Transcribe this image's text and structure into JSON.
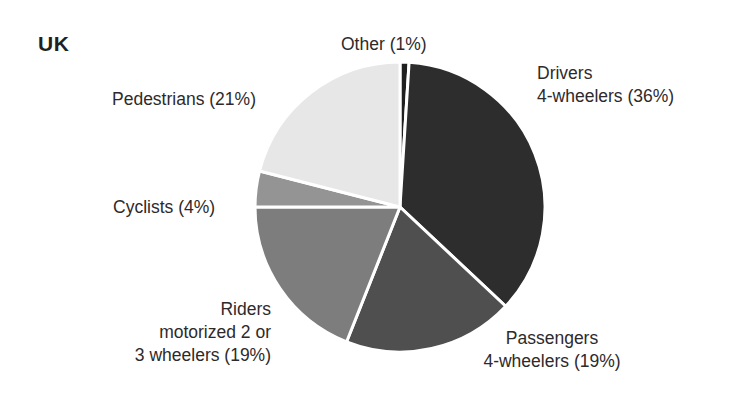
{
  "title": "UK",
  "background_color": "#ffffff",
  "text_color": "#2e2a2b",
  "labels": {
    "other": {
      "line1": "Other (1%)"
    },
    "drivers": {
      "line1": "Drivers",
      "line2": "4-wheelers (36%)"
    },
    "pedestrians": {
      "line1": "Pedestrians (21%)"
    },
    "cyclists": {
      "line1": "Cyclists (4%)"
    },
    "riders": {
      "line1": "Riders",
      "line2": "motorized 2 or",
      "line3": "3 wheelers (19%)"
    },
    "passengers": {
      "line1": "Passengers",
      "line2": "4-wheelers (19%)"
    }
  },
  "chart_data": {
    "type": "pie",
    "title": "UK",
    "unit": "%",
    "start_angle_deg": 0,
    "direction": "clockwise",
    "center": {
      "x": 400,
      "y": 207
    },
    "radius": 145,
    "slice_gap_color": "#ffffff",
    "categories": [
      "Other",
      "Drivers 4-wheelers",
      "Passengers 4-wheelers",
      "Riders motorized 2 or 3 wheelers",
      "Cyclists",
      "Pedestrians"
    ],
    "values": [
      1,
      36,
      19,
      19,
      4,
      21
    ],
    "colors": [
      "#1f1f1f",
      "#2d2d2d",
      "#4f4f4f",
      "#7d7d7d",
      "#949494",
      "#e7e7e7"
    ],
    "slices": [
      {
        "name": "Other",
        "label": "Other (1%)",
        "value": 1,
        "color": "#1f1f1f"
      },
      {
        "name": "Drivers 4-wheelers",
        "label": "Drivers 4-wheelers (36%)",
        "value": 36,
        "color": "#2d2d2d"
      },
      {
        "name": "Passengers 4-wheelers",
        "label": "Passengers 4-wheelers (19%)",
        "value": 19,
        "color": "#4f4f4f"
      },
      {
        "name": "Riders motorized 2 or 3 wheelers",
        "label": "Riders motorized 2 or 3 wheelers (19%)",
        "value": 19,
        "color": "#7d7d7d"
      },
      {
        "name": "Cyclists",
        "label": "Cyclists (4%)",
        "value": 4,
        "color": "#949494"
      },
      {
        "name": "Pedestrians",
        "label": "Pedestrians (21%)",
        "value": 21,
        "color": "#e7e7e7"
      }
    ],
    "legend": "none",
    "grid": false
  }
}
